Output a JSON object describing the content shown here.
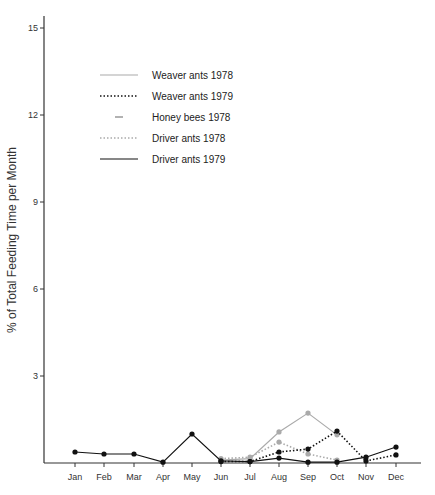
{
  "chart_data": {
    "type": "line",
    "title": "",
    "xlabel": "",
    "ylabel": "% of Total Feeding Time per Month",
    "ylim": [
      0,
      15
    ],
    "yticks": [
      3,
      6,
      9,
      12,
      15
    ],
    "grid": false,
    "legend_position": "upper-left inside plot",
    "categories": [
      "Jan",
      "Feb",
      "Mar",
      "Apr",
      "May",
      "Jun",
      "Jul",
      "Aug",
      "Sep",
      "Oct",
      "Nov",
      "Dec"
    ],
    "series": [
      {
        "name": "Weaver ants 1978",
        "style": "solid",
        "color": "#aaaaaa",
        "values": [
          null,
          null,
          null,
          null,
          null,
          0.1,
          0.15,
          1.07,
          1.72,
          0.97,
          null,
          null
        ]
      },
      {
        "name": "Weaver ants 1979",
        "style": "dotted",
        "color": "#111111",
        "values": [
          null,
          null,
          null,
          null,
          null,
          0.05,
          0.05,
          0.38,
          0.48,
          1.1,
          0.07,
          0.28
        ]
      },
      {
        "name": "Honey bees 1978",
        "style": "short-dash",
        "color": "#999999",
        "values": [
          null,
          null,
          null,
          null,
          null,
          null,
          null,
          null,
          null,
          null,
          null,
          null
        ]
      },
      {
        "name": "Driver ants 1978",
        "style": "dotted",
        "color": "#aaaaaa",
        "values": [
          null,
          null,
          null,
          null,
          null,
          0.15,
          0.2,
          0.72,
          0.31,
          0.1,
          null,
          null
        ]
      },
      {
        "name": "Driver ants 1979",
        "style": "solid",
        "color": "#111111",
        "values": [
          0.38,
          0.31,
          0.31,
          0.03,
          1.0,
          0.07,
          0.05,
          0.17,
          0.03,
          0.03,
          0.2,
          0.55
        ]
      }
    ]
  },
  "legend": [
    {
      "label": "Weaver ants 1978"
    },
    {
      "label": "Weaver ants 1979"
    },
    {
      "label": "Honey bees 1978"
    },
    {
      "label": "Driver ants 1978"
    },
    {
      "label": "Driver ants 1979"
    }
  ],
  "axes": {
    "ylabel": "% of Total Feeding Time per Month",
    "yticks": [
      "3",
      "6",
      "9",
      "12",
      "15"
    ],
    "xticks": [
      "Jan",
      "Feb",
      "Mar",
      "Apr",
      "May",
      "Jun",
      "Jul",
      "Aug",
      "Sep",
      "Oct",
      "Nov",
      "Dec"
    ]
  }
}
